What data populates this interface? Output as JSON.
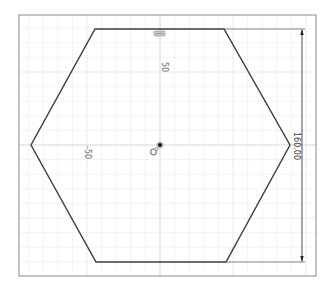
{
  "viewport": {
    "frame": {
      "x": 19,
      "y": 15,
      "width": 297,
      "height": 261,
      "stroke": "#8a8a8a"
    },
    "origin": {
      "x": 160,
      "y": 145
    },
    "grid": {
      "minor_spacing_px": 14.6,
      "minor_color": "#efefef",
      "major_color": "#e2e2e2",
      "axis_color": "#d0d0d0"
    }
  },
  "sketch": {
    "shape": "hexagon",
    "stroke": "#3c3c3c",
    "vertices": [
      [
        95,
        29
      ],
      [
        224,
        29
      ],
      [
        290,
        145
      ],
      [
        226,
        262
      ],
      [
        96,
        262
      ],
      [
        31,
        145
      ]
    ]
  },
  "axis_labels": {
    "y_50": "50",
    "x_minus_50": "-50"
  },
  "dimension": {
    "value": "160.00",
    "line_x": 302,
    "top_y": 29,
    "bottom_y": 262,
    "color": "#3a3a3a"
  },
  "glyphs": {
    "top_constraint": "horizontal-constraint-icon",
    "origin_point": "origin-point-icon",
    "coincident": "coincident-constraint-icon"
  }
}
